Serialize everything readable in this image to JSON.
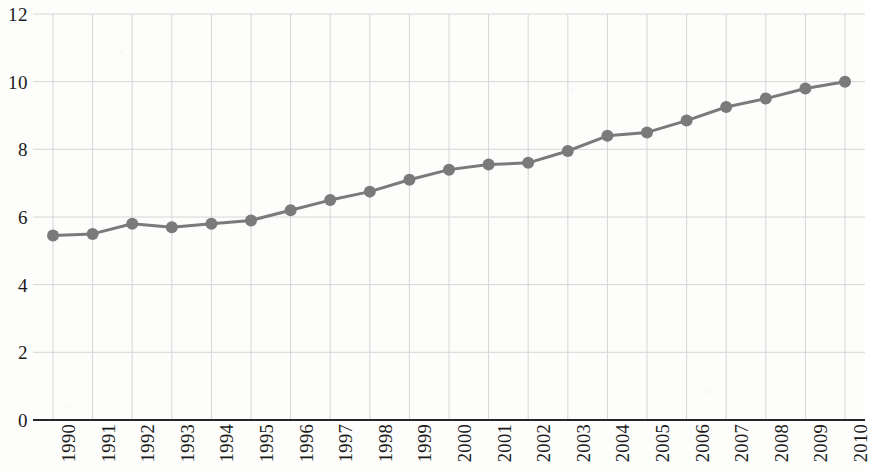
{
  "chart_data": {
    "type": "line",
    "title": "",
    "subtitle": "",
    "xlabel": "",
    "ylabel": "",
    "grid": true,
    "legend": false,
    "legend_position": "none",
    "marker": "circle",
    "line_color": "#7a7a7a",
    "marker_color": "#7a7a7a",
    "grid_color": "#d6d6d6",
    "axis_color": "#262626",
    "xlim": [
      1990,
      2010
    ],
    "ylim": [
      0,
      12
    ],
    "ytick_labels": [
      "0",
      "2",
      "4",
      "6",
      "8",
      "10",
      "12"
    ],
    "yticks": [
      0,
      2,
      4,
      6,
      8,
      10,
      12
    ],
    "categories": [
      "1990",
      "1991",
      "1992",
      "1993",
      "1994",
      "1995",
      "1996",
      "1997",
      "1998",
      "1999",
      "2000",
      "2001",
      "2002",
      "2003",
      "2004",
      "2005",
      "2006",
      "2007",
      "2008",
      "2009",
      "2010"
    ],
    "x": [
      1990,
      1991,
      1992,
      1993,
      1994,
      1995,
      1996,
      1997,
      1998,
      1999,
      2000,
      2001,
      2002,
      2003,
      2004,
      2005,
      2006,
      2007,
      2008,
      2009,
      2010
    ],
    "values": [
      5.45,
      5.5,
      5.8,
      5.7,
      5.8,
      5.9,
      6.2,
      6.5,
      6.75,
      7.1,
      7.4,
      7.55,
      7.6,
      7.95,
      8.4,
      8.5,
      8.85,
      9.25,
      9.5,
      9.8,
      10.0
    ]
  }
}
